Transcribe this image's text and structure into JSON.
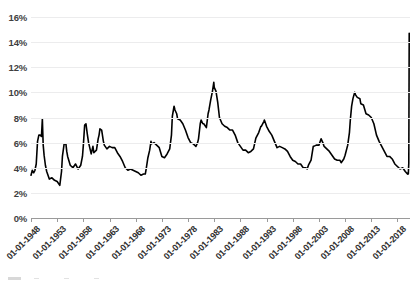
{
  "chart_data": {
    "type": "line",
    "title": "",
    "xlabel": "",
    "ylabel": "",
    "ylim": [
      0,
      16
    ],
    "ytick_labels": [
      "0%",
      "2%",
      "4%",
      "6%",
      "8%",
      "10%",
      "12%",
      "14%",
      "16%"
    ],
    "ytick_values": [
      0,
      2,
      4,
      6,
      8,
      10,
      12,
      14,
      16
    ],
    "grid": true,
    "legend": "none",
    "line_color": "#000000",
    "grid_color": "#ececed",
    "axis_color": "#9a9a9a",
    "xtick_labels": [
      "01-01-1948",
      "01-01-1953",
      "01-01-1958",
      "01-01-1963",
      "01-01-1968",
      "01-01-1973",
      "01-01-1978",
      "01-01-1983",
      "01-01-1988",
      "01-01-1993",
      "01-01-1998",
      "01-01-2003",
      "01-01-2008",
      "01-01-2013",
      "01-01-2018"
    ],
    "x_start_year": 1948,
    "x_end_year": 2020.4,
    "series": [
      {
        "name": "Unemployment rate",
        "points": [
          [
            1948.0,
            3.4
          ],
          [
            1948.25,
            3.8
          ],
          [
            1948.5,
            3.6
          ],
          [
            1948.75,
            3.8
          ],
          [
            1949.0,
            4.3
          ],
          [
            1949.25,
            6.1
          ],
          [
            1949.5,
            6.6
          ],
          [
            1949.75,
            6.6
          ],
          [
            1950.0,
            6.5
          ],
          [
            1950.17,
            7.9
          ],
          [
            1950.33,
            5.8
          ],
          [
            1950.5,
            5.0
          ],
          [
            1950.75,
            4.2
          ],
          [
            1951.0,
            3.7
          ],
          [
            1951.5,
            3.1
          ],
          [
            1952.0,
            3.2
          ],
          [
            1952.5,
            3.0
          ],
          [
            1953.0,
            2.9
          ],
          [
            1953.5,
            2.6
          ],
          [
            1953.83,
            3.7
          ],
          [
            1954.0,
            4.9
          ],
          [
            1954.33,
            5.9
          ],
          [
            1954.67,
            5.9
          ],
          [
            1954.83,
            5.3
          ],
          [
            1955.0,
            4.9
          ],
          [
            1955.5,
            4.2
          ],
          [
            1956.0,
            4.0
          ],
          [
            1956.5,
            4.3
          ],
          [
            1957.0,
            3.9
          ],
          [
            1957.5,
            4.2
          ],
          [
            1957.83,
            4.9
          ],
          [
            1958.0,
            5.8
          ],
          [
            1958.25,
            7.4
          ],
          [
            1958.5,
            7.5
          ],
          [
            1958.75,
            6.7
          ],
          [
            1959.0,
            6.0
          ],
          [
            1959.5,
            5.1
          ],
          [
            1959.83,
            5.7
          ],
          [
            1960.0,
            5.2
          ],
          [
            1960.5,
            5.4
          ],
          [
            1960.83,
            6.3
          ],
          [
            1961.0,
            6.6
          ],
          [
            1961.17,
            7.1
          ],
          [
            1961.5,
            7.0
          ],
          [
            1961.83,
            6.1
          ],
          [
            1962.0,
            5.8
          ],
          [
            1962.5,
            5.5
          ],
          [
            1963.0,
            5.7
          ],
          [
            1963.5,
            5.6
          ],
          [
            1964.0,
            5.6
          ],
          [
            1964.5,
            5.2
          ],
          [
            1965.0,
            4.9
          ],
          [
            1965.5,
            4.5
          ],
          [
            1966.0,
            4.0
          ],
          [
            1966.5,
            3.8
          ],
          [
            1967.0,
            3.9
          ],
          [
            1967.5,
            3.8
          ],
          [
            1968.0,
            3.7
          ],
          [
            1968.5,
            3.6
          ],
          [
            1969.0,
            3.4
          ],
          [
            1969.5,
            3.5
          ],
          [
            1969.83,
            3.5
          ],
          [
            1970.0,
            3.9
          ],
          [
            1970.33,
            4.8
          ],
          [
            1970.67,
            5.4
          ],
          [
            1970.92,
            6.1
          ],
          [
            1971.0,
            5.9
          ],
          [
            1971.5,
            6.0
          ],
          [
            1972.0,
            5.8
          ],
          [
            1972.5,
            5.6
          ],
          [
            1973.0,
            4.9
          ],
          [
            1973.5,
            4.8
          ],
          [
            1974.0,
            5.1
          ],
          [
            1974.5,
            5.5
          ],
          [
            1974.83,
            6.6
          ],
          [
            1975.0,
            8.1
          ],
          [
            1975.33,
            8.9
          ],
          [
            1975.5,
            8.6
          ],
          [
            1975.83,
            8.3
          ],
          [
            1976.0,
            7.9
          ],
          [
            1976.5,
            7.8
          ],
          [
            1977.0,
            7.5
          ],
          [
            1977.5,
            7.0
          ],
          [
            1978.0,
            6.4
          ],
          [
            1978.5,
            6.0
          ],
          [
            1979.0,
            5.9
          ],
          [
            1979.5,
            5.7
          ],
          [
            1979.83,
            6.0
          ],
          [
            1980.0,
            6.3
          ],
          [
            1980.33,
            7.5
          ],
          [
            1980.5,
            7.8
          ],
          [
            1980.83,
            7.5
          ],
          [
            1981.0,
            7.5
          ],
          [
            1981.5,
            7.2
          ],
          [
            1981.83,
            8.3
          ],
          [
            1982.0,
            8.6
          ],
          [
            1982.33,
            9.4
          ],
          [
            1982.67,
            10.1
          ],
          [
            1982.92,
            10.8
          ],
          [
            1983.0,
            10.4
          ],
          [
            1983.33,
            10.1
          ],
          [
            1983.67,
            9.2
          ],
          [
            1983.92,
            8.3
          ],
          [
            1984.0,
            8.0
          ],
          [
            1984.5,
            7.5
          ],
          [
            1985.0,
            7.3
          ],
          [
            1985.5,
            7.2
          ],
          [
            1986.0,
            7.0
          ],
          [
            1986.5,
            7.0
          ],
          [
            1987.0,
            6.6
          ],
          [
            1987.5,
            6.0
          ],
          [
            1988.0,
            5.7
          ],
          [
            1988.5,
            5.4
          ],
          [
            1989.0,
            5.4
          ],
          [
            1989.5,
            5.2
          ],
          [
            1990.0,
            5.3
          ],
          [
            1990.5,
            5.5
          ],
          [
            1990.92,
            6.3
          ],
          [
            1991.0,
            6.4
          ],
          [
            1991.5,
            6.8
          ],
          [
            1991.92,
            7.3
          ],
          [
            1992.0,
            7.3
          ],
          [
            1992.5,
            7.7
          ],
          [
            1992.58,
            7.8
          ],
          [
            1992.92,
            7.4
          ],
          [
            1993.0,
            7.3
          ],
          [
            1993.5,
            6.9
          ],
          [
            1994.0,
            6.6
          ],
          [
            1994.5,
            6.1
          ],
          [
            1995.0,
            5.6
          ],
          [
            1995.5,
            5.7
          ],
          [
            1996.0,
            5.6
          ],
          [
            1996.5,
            5.5
          ],
          [
            1997.0,
            5.3
          ],
          [
            1997.5,
            4.9
          ],
          [
            1998.0,
            4.6
          ],
          [
            1998.5,
            4.5
          ],
          [
            1999.0,
            4.3
          ],
          [
            1999.5,
            4.3
          ],
          [
            2000.0,
            4.0
          ],
          [
            2000.5,
            4.0
          ],
          [
            2000.75,
            3.9
          ],
          [
            2001.0,
            4.2
          ],
          [
            2001.5,
            4.6
          ],
          [
            2001.92,
            5.7
          ],
          [
            2002.0,
            5.7
          ],
          [
            2002.5,
            5.8
          ],
          [
            2003.0,
            5.8
          ],
          [
            2003.42,
            6.3
          ],
          [
            2003.75,
            6.0
          ],
          [
            2004.0,
            5.7
          ],
          [
            2004.5,
            5.5
          ],
          [
            2005.0,
            5.3
          ],
          [
            2005.5,
            5.0
          ],
          [
            2006.0,
            4.7
          ],
          [
            2006.5,
            4.6
          ],
          [
            2007.0,
            4.6
          ],
          [
            2007.25,
            4.4
          ],
          [
            2007.75,
            4.7
          ],
          [
            2008.0,
            5.0
          ],
          [
            2008.5,
            5.8
          ],
          [
            2008.83,
            6.8
          ],
          [
            2009.0,
            7.8
          ],
          [
            2009.25,
            8.9
          ],
          [
            2009.5,
            9.5
          ],
          [
            2009.83,
            10.0
          ],
          [
            2010.0,
            9.8
          ],
          [
            2010.33,
            9.6
          ],
          [
            2010.83,
            9.5
          ],
          [
            2011.0,
            9.1
          ],
          [
            2011.5,
            9.0
          ],
          [
            2012.0,
            8.3
          ],
          [
            2012.5,
            8.2
          ],
          [
            2013.0,
            8.0
          ],
          [
            2013.5,
            7.5
          ],
          [
            2014.0,
            6.6
          ],
          [
            2014.5,
            6.1
          ],
          [
            2015.0,
            5.7
          ],
          [
            2015.5,
            5.3
          ],
          [
            2016.0,
            4.9
          ],
          [
            2016.5,
            4.9
          ],
          [
            2017.0,
            4.7
          ],
          [
            2017.5,
            4.3
          ],
          [
            2018.0,
            4.1
          ],
          [
            2018.5,
            3.9
          ],
          [
            2019.0,
            4.0
          ],
          [
            2019.5,
            3.7
          ],
          [
            2019.92,
            3.5
          ],
          [
            2020.0,
            3.6
          ],
          [
            2020.08,
            3.5
          ],
          [
            2020.17,
            4.4
          ],
          [
            2020.25,
            14.7
          ]
        ]
      }
    ],
    "annotations": {
      "peaks": [
        {
          "year": 1950.17,
          "value": 7.9
        },
        {
          "year": 1958.5,
          "value": 7.5
        },
        {
          "year": 1961.17,
          "value": 7.1
        },
        {
          "year": 1975.33,
          "value": 8.9
        },
        {
          "year": 1982.92,
          "value": 10.8
        },
        {
          "year": 1992.58,
          "value": 7.8
        },
        {
          "year": 2009.83,
          "value": 10.0
        },
        {
          "year": 2020.25,
          "value": 14.7
        }
      ]
    }
  }
}
